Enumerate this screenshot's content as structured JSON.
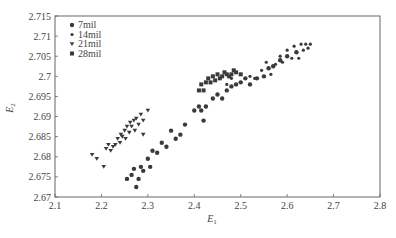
{
  "chart_data": {
    "type": "scatter",
    "title": "",
    "xlabel": "E1",
    "ylabel": "E2",
    "xlim": [
      2.1,
      2.8
    ],
    "ylim": [
      2.67,
      2.715
    ],
    "xticks": [
      "2.1",
      "2.2",
      "2.3",
      "2.4",
      "2.5",
      "2.6",
      "2.7",
      "2.8"
    ],
    "yticks": [
      "2.67",
      "2.675",
      "2.68",
      "2.685",
      "2.69",
      "2.695",
      "2.7",
      "2.705",
      "2.71",
      "2.715"
    ],
    "grid": false,
    "legend_position": "upper-left",
    "series": [
      {
        "name": "7mil",
        "marker": "circle",
        "points": [
          [
            2.255,
            2.6745
          ],
          [
            2.265,
            2.6755
          ],
          [
            2.27,
            2.677
          ],
          [
            2.275,
            2.6725
          ],
          [
            2.28,
            2.6745
          ],
          [
            2.285,
            2.6775
          ],
          [
            2.29,
            2.6765
          ],
          [
            2.3,
            2.6795
          ],
          [
            2.305,
            2.6775
          ],
          [
            2.31,
            2.6815
          ],
          [
            2.32,
            2.681
          ],
          [
            2.33,
            2.6835
          ],
          [
            2.34,
            2.6825
          ],
          [
            2.35,
            2.6865
          ],
          [
            2.36,
            2.6845
          ],
          [
            2.37,
            2.6855
          ],
          [
            2.38,
            2.688
          ],
          [
            2.4,
            2.6915
          ],
          [
            2.41,
            2.6925
          ],
          [
            2.415,
            2.6915
          ],
          [
            2.42,
            2.689
          ],
          [
            2.425,
            2.6925
          ],
          [
            2.44,
            2.6945
          ],
          [
            2.45,
            2.6955
          ],
          [
            2.46,
            2.6945
          ],
          [
            2.47,
            2.6965
          ],
          [
            2.48,
            2.6975
          ],
          [
            2.49,
            2.698
          ],
          [
            2.5,
            2.6985
          ],
          [
            2.51,
            2.6995
          ],
          [
            2.52,
            2.698
          ],
          [
            2.535,
            2.6995
          ],
          [
            2.55,
            2.7
          ],
          [
            2.56,
            2.702
          ],
          [
            2.57,
            2.7025
          ],
          [
            2.585,
            2.704
          ],
          [
            2.6,
            2.705
          ],
          [
            2.62,
            2.706
          ]
        ]
      },
      {
        "name": "14mil",
        "marker": "dot",
        "points": [
          [
            2.47,
            2.698
          ],
          [
            2.48,
            2.6995
          ],
          [
            2.5,
            2.6985
          ],
          [
            2.52,
            2.7
          ],
          [
            2.53,
            2.6995
          ],
          [
            2.545,
            2.7015
          ],
          [
            2.555,
            2.7035
          ],
          [
            2.565,
            2.7005
          ],
          [
            2.575,
            2.703
          ],
          [
            2.585,
            2.705
          ],
          [
            2.59,
            2.7035
          ],
          [
            2.6,
            2.7065
          ],
          [
            2.61,
            2.7045
          ],
          [
            2.615,
            2.7075
          ],
          [
            2.62,
            2.706
          ],
          [
            2.625,
            2.7045
          ],
          [
            2.63,
            2.708
          ],
          [
            2.635,
            2.7065
          ],
          [
            2.64,
            2.708
          ],
          [
            2.645,
            2.707
          ],
          [
            2.65,
            2.708
          ]
        ]
      },
      {
        "name": "21mil",
        "marker": "triangle-down",
        "points": [
          [
            2.18,
            2.6805
          ],
          [
            2.19,
            2.6795
          ],
          [
            2.205,
            2.6775
          ],
          [
            2.21,
            2.682
          ],
          [
            2.215,
            2.683
          ],
          [
            2.22,
            2.6815
          ],
          [
            2.225,
            2.6825
          ],
          [
            2.23,
            2.683
          ],
          [
            2.235,
            2.6845
          ],
          [
            2.24,
            2.6835
          ],
          [
            2.242,
            2.6855
          ],
          [
            2.245,
            2.685
          ],
          [
            2.25,
            2.6865
          ],
          [
            2.252,
            2.6845
          ],
          [
            2.255,
            2.6875
          ],
          [
            2.26,
            2.686
          ],
          [
            2.262,
            2.6885
          ],
          [
            2.265,
            2.6875
          ],
          [
            2.27,
            2.689
          ],
          [
            2.272,
            2.6865
          ],
          [
            2.275,
            2.6895
          ],
          [
            2.28,
            2.688
          ],
          [
            2.285,
            2.6905
          ],
          [
            2.29,
            2.6855
          ],
          [
            2.29,
            2.689
          ],
          [
            2.3,
            2.6915
          ]
        ]
      },
      {
        "name": "28mil",
        "marker": "square",
        "points": [
          [
            2.41,
            2.6965
          ],
          [
            2.415,
            2.698
          ],
          [
            2.42,
            2.6965
          ],
          [
            2.425,
            2.6985
          ],
          [
            2.43,
            2.6995
          ],
          [
            2.435,
            2.6985
          ],
          [
            2.44,
            2.7
          ],
          [
            2.445,
            2.699
          ],
          [
            2.45,
            2.7005
          ],
          [
            2.455,
            2.6995
          ],
          [
            2.46,
            2.7
          ],
          [
            2.465,
            2.701
          ],
          [
            2.47,
            2.7005
          ],
          [
            2.475,
            2.7
          ],
          [
            2.48,
            2.7005
          ],
          [
            2.485,
            2.7015
          ],
          [
            2.49,
            2.701
          ],
          [
            2.5,
            2.7005
          ]
        ]
      }
    ]
  },
  "legend": {
    "items": [
      "7mil",
      "14mil",
      "21mil",
      "28mil"
    ]
  },
  "axes": {
    "xlabel_main": "E",
    "xlabel_sub": "1",
    "ylabel_main": "E",
    "ylabel_sub": "2"
  }
}
